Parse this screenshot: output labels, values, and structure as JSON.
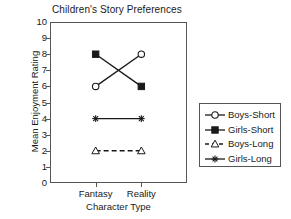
{
  "chart_data": {
    "type": "line",
    "title": "Children's Story Preferences",
    "xlabel": "Character Type",
    "ylabel": "Mean Enjoyment Rating",
    "categories": [
      "Fantasy",
      "Reality"
    ],
    "ylim": [
      0,
      10
    ],
    "yticks": [
      "0",
      "1",
      "2",
      "3",
      "4",
      "5",
      "6",
      "7",
      "8",
      "9",
      "10"
    ],
    "grid": false,
    "legend_position": "right-outside",
    "series": [
      {
        "name": "Boys-Short",
        "values": [
          6,
          8
        ],
        "marker": "open-circle",
        "linestyle": "solid",
        "color": "#1a1a1a"
      },
      {
        "name": "Girls-Short",
        "values": [
          8,
          6
        ],
        "marker": "filled-square",
        "linestyle": "solid",
        "color": "#1a1a1a"
      },
      {
        "name": "Boys-Long",
        "values": [
          2,
          2
        ],
        "marker": "open-triangle",
        "linestyle": "dashed",
        "color": "#1a1a1a"
      },
      {
        "name": "Girls-Long",
        "values": [
          4,
          4
        ],
        "marker": "asterisk",
        "linestyle": "solid",
        "color": "#1a1a1a"
      }
    ]
  },
  "legend": {
    "entries": [
      {
        "label": "Boys-Short"
      },
      {
        "label": "Girls-Short"
      },
      {
        "label": "Boys-Long"
      },
      {
        "label": "Girls-Long"
      }
    ]
  }
}
